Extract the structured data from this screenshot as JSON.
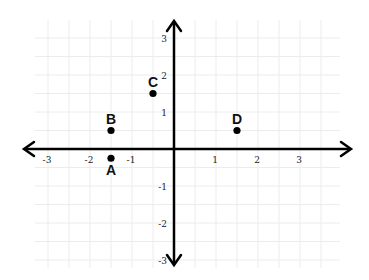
{
  "chart_data": {
    "type": "scatter",
    "title": "",
    "xlabel": "",
    "ylabel": "",
    "xlim": [
      -3.5,
      4
    ],
    "ylim": [
      -3.2,
      3.6
    ],
    "grid": true,
    "grid_minor_step": 0.5,
    "x_ticks": [
      -3,
      -2,
      -1,
      1,
      2,
      3
    ],
    "y_ticks": [
      -3,
      -2,
      -1,
      1,
      2,
      3
    ],
    "x_tick_labels": [
      "-3",
      "-2",
      "-1",
      "1",
      "2",
      "3"
    ],
    "y_tick_labels": [
      "-3",
      "-2",
      "-1",
      "1",
      "2",
      "3"
    ],
    "points": [
      {
        "label": "A",
        "x": -1.5,
        "y": -0.25
      },
      {
        "label": "B",
        "x": -1.5,
        "y": 0.5
      },
      {
        "label": "C",
        "x": -0.5,
        "y": 1.5
      },
      {
        "label": "D",
        "x": 1.5,
        "y": 0.5
      }
    ]
  },
  "style": {
    "axis_color": "#000000",
    "grid_color": "#ececec",
    "point_color": "#000000"
  }
}
